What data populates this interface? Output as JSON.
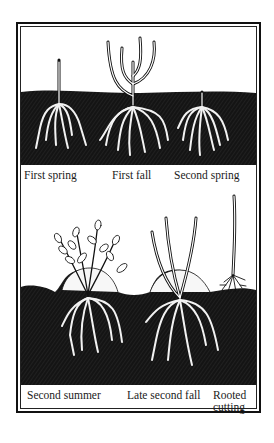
{
  "figure": {
    "type": "illustration",
    "colors": {
      "ink": "#111111",
      "paper": "#ffffff",
      "soil": "#141414",
      "roots": "#f2f2f2"
    },
    "top_panel": {
      "labels": [
        {
          "text": "First spring"
        },
        {
          "text": "First fall"
        },
        {
          "text": "Second spring"
        }
      ]
    },
    "bottom_panel": {
      "labels": [
        {
          "text": "Second summer"
        },
        {
          "text": "Late second fall"
        },
        {
          "text": "Rooted"
        },
        {
          "text": "cutting"
        }
      ]
    }
  }
}
